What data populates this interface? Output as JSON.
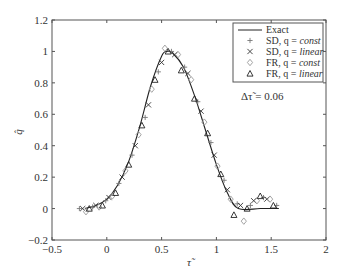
{
  "chart_data": {
    "type": "line",
    "title": "",
    "xlabel": "τ̃",
    "ylabel": "q̂",
    "xlim": [
      -0.5,
      2
    ],
    "ylim": [
      -0.2,
      1.2
    ],
    "xticks": [
      -0.5,
      0,
      0.5,
      1,
      1.5,
      2
    ],
    "xtick_labels": [
      "−0.5",
      "0",
      "0.5",
      "1",
      "1.5",
      "2"
    ],
    "yticks": [
      -0.2,
      0,
      0.2,
      0.4,
      0.6,
      0.8,
      1,
      1.2
    ],
    "ytick_labels": [
      "−0.2",
      "0",
      "0.2",
      "0.4",
      "0.6",
      "0.8",
      "1",
      "1.2"
    ],
    "grid": false,
    "legend_position": "upper right",
    "annotation": "Δτ̃ = 0.06",
    "series": [
      {
        "name": "Exact",
        "style": "solid-line",
        "color": "#222222",
        "x": [
          -0.2,
          -0.1,
          0.0,
          0.1,
          0.2,
          0.3,
          0.4,
          0.5,
          0.55,
          0.6,
          0.7,
          0.8,
          0.9,
          1.0,
          1.1,
          1.2,
          1.4,
          1.57
        ],
        "y": [
          0.0,
          0.02,
          0.06,
          0.15,
          0.3,
          0.52,
          0.78,
          0.97,
          1.0,
          0.99,
          0.9,
          0.72,
          0.5,
          0.28,
          0.1,
          0.0,
          0.0,
          0.0
        ]
      },
      {
        "name": "SD, q = const",
        "marker": "plus",
        "color": "#777777",
        "x": [
          -0.25,
          -0.13,
          -0.01,
          0.11,
          0.23,
          0.35,
          0.47,
          0.59,
          0.71,
          0.83,
          0.95,
          1.07,
          1.19,
          1.31,
          1.43,
          1.55
        ],
        "y": [
          0.0,
          0.01,
          0.05,
          0.16,
          0.34,
          0.58,
          0.87,
          1.0,
          0.9,
          0.68,
          0.42,
          0.18,
          0.03,
          0.02,
          0.07,
          0.02
        ]
      },
      {
        "name": "SD, q = linear",
        "marker": "x",
        "color": "#333333",
        "x": [
          -0.22,
          -0.1,
          0.02,
          0.14,
          0.26,
          0.38,
          0.5,
          0.62,
          0.74,
          0.86,
          0.98,
          1.1,
          1.22,
          1.34,
          1.46
        ],
        "y": [
          0.0,
          0.02,
          0.07,
          0.2,
          0.4,
          0.66,
          0.93,
          0.98,
          0.86,
          0.62,
          0.34,
          0.12,
          0.02,
          0.05,
          0.06
        ]
      },
      {
        "name": "FR, q = const",
        "marker": "diamond",
        "color": "#999999",
        "x": [
          -0.19,
          -0.07,
          0.05,
          0.17,
          0.29,
          0.41,
          0.53,
          0.65,
          0.77,
          0.89,
          1.01,
          1.13,
          1.25,
          1.37,
          1.49
        ],
        "y": [
          -0.02,
          0.01,
          0.08,
          0.24,
          0.47,
          0.76,
          1.02,
          0.98,
          0.82,
          0.55,
          0.27,
          0.06,
          -0.08,
          0.05,
          0.06
        ]
      },
      {
        "name": "FR, q = linear",
        "marker": "triangle",
        "color": "#222222",
        "x": [
          -0.16,
          -0.04,
          0.08,
          0.2,
          0.32,
          0.44,
          0.56,
          0.68,
          0.8,
          0.92,
          1.04,
          1.16,
          1.28,
          1.4,
          1.52
        ],
        "y": [
          0.0,
          0.02,
          0.1,
          0.28,
          0.53,
          0.82,
          1.0,
          0.88,
          0.7,
          0.48,
          0.22,
          -0.04,
          0.0,
          0.08,
          0.02
        ]
      }
    ]
  },
  "legend": {
    "items": [
      {
        "label_prefix": "Exact",
        "label_italic": ""
      },
      {
        "label_prefix": "SD, q = ",
        "label_italic": "const"
      },
      {
        "label_prefix": "SD, q = ",
        "label_italic": "linear"
      },
      {
        "label_prefix": "FR, q = ",
        "label_italic": "const"
      },
      {
        "label_prefix": "FR, q = ",
        "label_italic": "linear"
      }
    ]
  },
  "annotation": {
    "text": "Δτ̃ = 0.06"
  },
  "axes": {
    "xlabel": "τ̃",
    "ylabel": "q̂"
  }
}
